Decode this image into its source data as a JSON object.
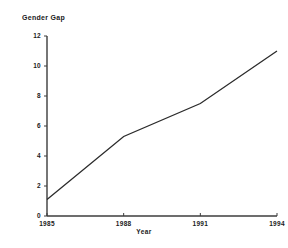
{
  "chart_data": {
    "type": "line",
    "title": "Gender Gap",
    "xlabel": "Year",
    "ylabel": "",
    "x": [
      1985,
      1988,
      1991,
      1994
    ],
    "xtick_labels": [
      "1985",
      "1988",
      "1991",
      "1994"
    ],
    "ytick_labels": [
      "0",
      "2",
      "4",
      "6",
      "8",
      "10",
      "12"
    ],
    "yticks": [
      0,
      2,
      4,
      6,
      8,
      10,
      12
    ],
    "ylim": [
      0,
      12
    ],
    "xlim": [
      1985,
      1994
    ],
    "grid": false,
    "legend": false,
    "series": [
      {
        "name": "Gender Gap",
        "values": [
          1.1,
          5.3,
          7.5,
          11.0
        ],
        "color": "#2b2b2b"
      }
    ]
  },
  "axis": {
    "line_color": "#3c3c3c"
  }
}
